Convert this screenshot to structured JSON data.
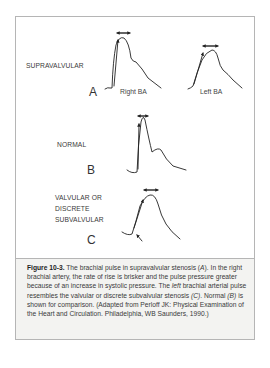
{
  "figure": {
    "panels": [
      {
        "letter": "A",
        "label": "SUPRAVALVULAR",
        "traces": [
          "Right BA",
          "Left BA"
        ]
      },
      {
        "letter": "B",
        "label": "NORMAL"
      },
      {
        "letter": "C",
        "label_lines": [
          "VALVULAR OR",
          "DISCRETE",
          "SUBVALVULAR"
        ]
      }
    ],
    "caption": {
      "figure_number": "Figure 10-3.",
      "text_1": " The brachial pulse in supravalvular stenosis (",
      "ref_a": "A",
      "text_2": "). In the right brachial artery, the rate of rise is brisker and the pulse pressure greater because of an increase in systolic pressure. The ",
      "left_word": "left",
      "text_3": " brachial arterial pulse resembles the valvular or discrete subvalvular stenosis ",
      "ref_c": "(C)",
      "text_4": ". Normal ",
      "ref_b": "(B)",
      "text_5": " is shown for comparison. (Adapted from Perloff JK: Physical Examination of the Heart and Circulation. Philadelphia, WB Saunders, 1990.)"
    },
    "colors": {
      "border": "#b5b5b5",
      "caption_background": "#f3f3f1",
      "trace": "#222222"
    }
  }
}
